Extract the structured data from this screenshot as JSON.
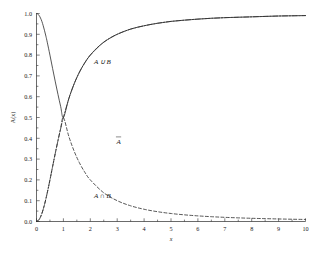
{
  "chart_data": {
    "type": "line",
    "title": "",
    "xlabel": "x",
    "ylabel": "A(x)",
    "xlim": [
      0,
      10
    ],
    "ylim": [
      0,
      1.0
    ],
    "grid": false,
    "legend_position": "inline-annotations",
    "xticks": [
      "0",
      "1",
      "2",
      "3",
      "4",
      "5",
      "6",
      "7",
      "8",
      "9",
      "10"
    ],
    "xtick_values": [
      0,
      1,
      2,
      3,
      4,
      5,
      6,
      7,
      8,
      9,
      10
    ],
    "yticks": [
      "0.0",
      "0.1",
      "0.2",
      "0.3",
      "0.4",
      "0.5",
      "0.6",
      "0.7",
      "0.8",
      "0.9",
      "1.0"
    ],
    "ytick_values": [
      0.0,
      0.1,
      0.2,
      0.3,
      0.4,
      0.5,
      0.6,
      0.7,
      0.8,
      0.9,
      1.0
    ],
    "annotations": [
      {
        "text": "A ∪ B",
        "x": 2.45,
        "y": 0.755,
        "style": "italic"
      },
      {
        "text": "Ā",
        "x": 3.05,
        "y": 0.375,
        "style": "italic"
      },
      {
        "text": "A ∩ B",
        "x": 2.45,
        "y": 0.115,
        "style": "italic"
      }
    ],
    "series": [
      {
        "name": "A ∪ B",
        "linestyle": "solid",
        "color": "#2b2b2b",
        "x": [
          0,
          0.05,
          0.1,
          0.15,
          0.2,
          0.25,
          0.3,
          0.35,
          0.4,
          0.5,
          0.6,
          0.7,
          0.8,
          0.9,
          1.0,
          1.2,
          1.4,
          1.6,
          1.8,
          2.0,
          2.25,
          2.5,
          2.75,
          3.0,
          3.5,
          4.0,
          4.5,
          5.0,
          5.5,
          6.0,
          6.5,
          7.0,
          7.5,
          8.0,
          8.5,
          9.0,
          9.5,
          10.0
        ],
        "y": [
          1.0,
          0.9975,
          0.99,
          0.978,
          0.962,
          0.941,
          0.917,
          0.891,
          0.862,
          0.8,
          0.735,
          0.671,
          0.61,
          0.552,
          0.5,
          0.59,
          0.662,
          0.719,
          0.764,
          0.8,
          0.835,
          0.862,
          0.883,
          0.9,
          0.925,
          0.941,
          0.953,
          0.962,
          0.968,
          0.973,
          0.977,
          0.98,
          0.982,
          0.984,
          0.986,
          0.988,
          0.989,
          0.99
        ]
      },
      {
        "name": "Ā",
        "linestyle": "dashdot",
        "color": "#2b2b2b",
        "x": [
          0,
          0.1,
          0.2,
          0.3,
          0.4,
          0.5,
          0.6,
          0.7,
          0.8,
          0.9,
          1.0,
          1.2,
          1.4,
          1.6,
          1.8,
          2.0,
          2.5,
          3.0,
          3.5,
          4.0,
          4.5,
          5.0,
          5.5,
          6.0,
          6.5,
          7.0,
          7.5,
          8.0,
          8.5,
          9.0,
          9.5,
          10.0
        ],
        "y": [
          0.0,
          0.0099,
          0.0385,
          0.0826,
          0.138,
          0.2,
          0.265,
          0.329,
          0.39,
          0.448,
          0.5,
          0.59,
          0.662,
          0.719,
          0.764,
          0.8,
          0.862,
          0.9,
          0.925,
          0.941,
          0.953,
          0.962,
          0.968,
          0.973,
          0.977,
          0.98,
          0.982,
          0.984,
          0.986,
          0.988,
          0.989,
          0.99
        ]
      },
      {
        "name": "A ∩ B",
        "linestyle": "dashed",
        "color": "#2b2b2b",
        "x": [
          0,
          0.1,
          0.2,
          0.3,
          0.4,
          0.5,
          0.6,
          0.7,
          0.8,
          0.9,
          1.0,
          1.2,
          1.4,
          1.6,
          1.8,
          2.0,
          2.5,
          3.0,
          3.5,
          4.0,
          4.5,
          5.0,
          5.5,
          6.0,
          6.5,
          7.0,
          7.5,
          8.0,
          8.5,
          9.0,
          9.5,
          10.0
        ],
        "y": [
          0.0,
          0.0099,
          0.0385,
          0.0826,
          0.138,
          0.2,
          0.265,
          0.329,
          0.39,
          0.448,
          0.5,
          0.41,
          0.338,
          0.281,
          0.236,
          0.2,
          0.138,
          0.1,
          0.0755,
          0.0588,
          0.0471,
          0.0385,
          0.032,
          0.027,
          0.0231,
          0.02,
          0.0175,
          0.0154,
          0.0137,
          0.0122,
          0.0109,
          0.0099
        ]
      }
    ],
    "notes": {
      "description": "Fuzzy set membership curves: A union B (solid), A complement (dash-dot), A intersect B (dashed). All three intersect at x=1, A(x)=0.5.",
      "intersection_point": {
        "x": 1,
        "y": 0.5
      }
    }
  }
}
